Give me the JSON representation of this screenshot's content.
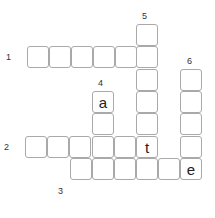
{
  "puzzle": {
    "type": "crossword",
    "cell_size": 22,
    "clues": [
      {
        "number": "1",
        "direction": "across",
        "label_pos": [
          6,
          52
        ]
      },
      {
        "number": "2",
        "direction": "across",
        "label_pos": [
          4,
          142
        ]
      },
      {
        "number": "3",
        "direction": "across",
        "label_pos": [
          58,
          186
        ]
      },
      {
        "number": "4",
        "direction": "down",
        "label_pos": [
          98,
          78
        ]
      },
      {
        "number": "5",
        "direction": "down",
        "label_pos": [
          142,
          11
        ]
      },
      {
        "number": "6",
        "direction": "down",
        "label_pos": [
          187,
          56
        ]
      }
    ],
    "cells": [
      {
        "x": 27,
        "y": 46,
        "letter": ""
      },
      {
        "x": 49,
        "y": 46,
        "letter": ""
      },
      {
        "x": 71,
        "y": 46,
        "letter": ""
      },
      {
        "x": 93,
        "y": 46,
        "letter": ""
      },
      {
        "x": 115,
        "y": 46,
        "letter": ""
      },
      {
        "x": 136,
        "y": 46,
        "letter": ""
      },
      {
        "x": 136,
        "y": 24,
        "letter": ""
      },
      {
        "x": 136,
        "y": 69,
        "letter": ""
      },
      {
        "x": 136,
        "y": 91,
        "letter": ""
      },
      {
        "x": 136,
        "y": 113,
        "letter": ""
      },
      {
        "x": 136,
        "y": 136,
        "letter": "t"
      },
      {
        "x": 92,
        "y": 91,
        "letter": "a"
      },
      {
        "x": 92,
        "y": 113,
        "letter": ""
      },
      {
        "x": 92,
        "y": 136,
        "letter": ""
      },
      {
        "x": 92,
        "y": 158,
        "letter": ""
      },
      {
        "x": 25,
        "y": 136,
        "letter": ""
      },
      {
        "x": 47,
        "y": 136,
        "letter": ""
      },
      {
        "x": 69,
        "y": 136,
        "letter": ""
      },
      {
        "x": 114,
        "y": 136,
        "letter": ""
      },
      {
        "x": 70,
        "y": 158,
        "letter": ""
      },
      {
        "x": 114,
        "y": 158,
        "letter": ""
      },
      {
        "x": 136,
        "y": 158,
        "letter": ""
      },
      {
        "x": 158,
        "y": 158,
        "letter": ""
      },
      {
        "x": 180,
        "y": 158,
        "letter": "e"
      },
      {
        "x": 180,
        "y": 69,
        "letter": ""
      },
      {
        "x": 180,
        "y": 91,
        "letter": ""
      },
      {
        "x": 180,
        "y": 113,
        "letter": ""
      },
      {
        "x": 180,
        "y": 136,
        "letter": ""
      }
    ]
  }
}
